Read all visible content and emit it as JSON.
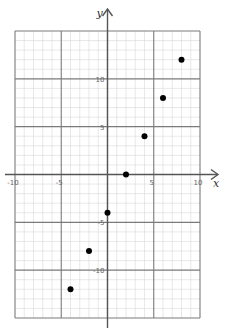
{
  "chart_data": {
    "type": "scatter",
    "title": "",
    "xlabel": "x",
    "ylabel": "y",
    "xlim": [
      -10,
      10
    ],
    "ylim": [
      -15,
      15
    ],
    "grid": true,
    "minor_grid_step": 1,
    "major_grid_step": 5,
    "x_ticks": [
      -10,
      -5,
      5,
      10
    ],
    "y_ticks": [
      10,
      5,
      -5,
      -10
    ],
    "x_tick_labels": [
      "-10",
      "-5",
      "5",
      "10"
    ],
    "y_tick_labels": [
      "10",
      "5",
      "-5",
      "-10"
    ],
    "points": [
      {
        "x": -4,
        "y": -12
      },
      {
        "x": -2,
        "y": -8
      },
      {
        "x": 0,
        "y": -4
      },
      {
        "x": 2,
        "y": 0
      },
      {
        "x": 4,
        "y": 4
      },
      {
        "x": 6,
        "y": 8
      },
      {
        "x": 8,
        "y": 12
      }
    ],
    "legend": null
  },
  "colors": {
    "background": "#ffffff",
    "minor_grid": "#d9d9d9",
    "major_grid": "#7a7a7a",
    "axis": "#555555",
    "point": "#000000"
  },
  "labels": {
    "x_axis": "x",
    "y_axis": "y"
  }
}
